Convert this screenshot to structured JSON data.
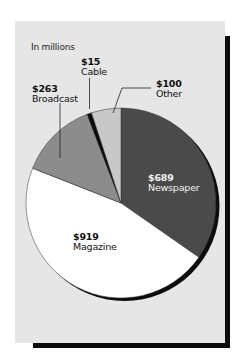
{
  "chart_data": {
    "type": "pie",
    "title": "",
    "subtitle": "In millions",
    "unit": "$ millions",
    "categories": [
      "Newspaper",
      "Magazine",
      "Broadcast",
      "Cable",
      "Other"
    ],
    "values": [
      689,
      919,
      263,
      15,
      100
    ],
    "value_labels": [
      "$689",
      "$919",
      "$263",
      "$15",
      "$100"
    ],
    "colors": [
      "#4a4a4a",
      "#ffffff",
      "#8c8c8c",
      "#0a0a0a",
      "#c8c8c8"
    ],
    "start_angle_deg": 0,
    "direction": "clockwise",
    "legend": "none (direct labels)",
    "background": "#e6e6e6"
  },
  "caption": "In millions",
  "labels": {
    "newspaper": {
      "value": "$689",
      "name": "Newspaper"
    },
    "magazine": {
      "value": "$919",
      "name": "Magazine"
    },
    "broadcast": {
      "value": "$263",
      "name": "Broadcast"
    },
    "cable": {
      "value": "$15",
      "name": "Cable"
    },
    "other": {
      "value": "$100",
      "name": "Other"
    }
  }
}
